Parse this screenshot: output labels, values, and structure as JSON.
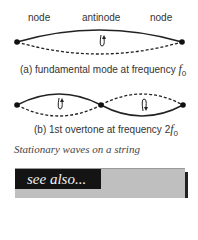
{
  "diagram_a": {
    "labels": {
      "left": "node",
      "center": "antinode",
      "right": "node"
    },
    "caption_prefix": "(a) fundamental mode at frequency ",
    "caption_symbol": "f",
    "caption_sub": "0"
  },
  "diagram_b": {
    "caption_prefix": "(b) 1st overtone at frequency 2",
    "caption_symbol": "f",
    "caption_sub": "0"
  },
  "title": "Stationary waves on a string",
  "see_also": {
    "label": "see also..."
  },
  "colors": {
    "ink": "#222222",
    "box": "#bfbfbf",
    "header": "#141414"
  }
}
